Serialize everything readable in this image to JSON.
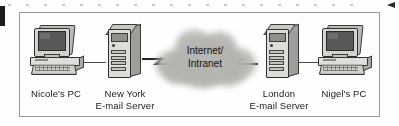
{
  "diagram": {
    "type": "network-topology",
    "frame": {
      "border_color": "#9a9a96",
      "background": "#fefefe"
    },
    "cloud": {
      "label_line1": "Internet/",
      "label_line2": "Intranet",
      "fill_color": "#b4b4b0"
    },
    "nodes": [
      {
        "id": "nicoles-pc",
        "icon": "desktop-computer-icon",
        "caption_line1": "Nicole's PC",
        "caption_line2": ""
      },
      {
        "id": "new-york-server",
        "icon": "tower-server-icon",
        "caption_line1": "New York",
        "caption_line2": "E-mail Server"
      },
      {
        "id": "london-server",
        "icon": "tower-server-icon",
        "caption_line1": "London",
        "caption_line2": "E-mail Server"
      },
      {
        "id": "nigels-pc",
        "icon": "desktop-computer-icon",
        "caption_line1": "Nigel's PC",
        "caption_line2": ""
      }
    ],
    "links": [
      {
        "id": "pc-to-ny",
        "style": "solid-line",
        "from": "nicoles-pc",
        "to": "new-york-server"
      },
      {
        "id": "ny-to-cloud",
        "style": "lightning-bolt",
        "from": "new-york-server",
        "to": "cloud"
      },
      {
        "id": "cloud-to-london",
        "style": "lightning-bolt",
        "from": "cloud",
        "to": "london-server"
      },
      {
        "id": "london-to-pc",
        "style": "solid-line",
        "from": "london-server",
        "to": "nigels-pc"
      }
    ]
  }
}
